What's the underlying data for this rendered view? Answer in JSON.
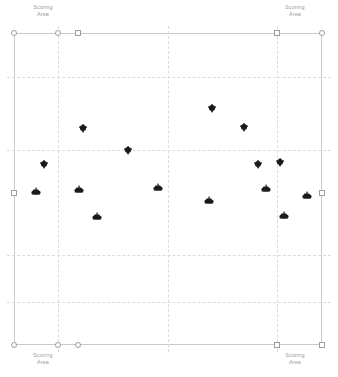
{
  "view": {
    "title": "Competition Field Layout",
    "background_color": "#ffffff",
    "border_color": "#c9c9c9",
    "grid_color": "#dcdcdc",
    "node_color": "#9e9e9e",
    "robot_color": "#1a1a1a",
    "label_color": "#9a9a9a"
  },
  "scoring_labels": [
    {
      "id": "top-left",
      "text": "Scoring\nArea",
      "corner": "tl"
    },
    {
      "id": "top-right",
      "text": "Scoring\nArea",
      "corner": "tr"
    },
    {
      "id": "bottom-left",
      "text": "Scoring\nArea",
      "corner": "bl"
    },
    {
      "id": "bottom-right",
      "text": "Scoring\nArea",
      "corner": "br"
    }
  ],
  "field": {
    "left": 14,
    "top": 33,
    "width": 308,
    "height": 312
  },
  "grid": {
    "vertical_x": [
      58,
      168,
      277
    ],
    "horizontal_y": [
      77,
      150,
      255,
      302
    ]
  },
  "nodes": [
    {
      "id": "n-tl-1",
      "x": 14,
      "y": 33,
      "shape": "circle"
    },
    {
      "id": "n-tl-2",
      "x": 58,
      "y": 33,
      "shape": "circle"
    },
    {
      "id": "n-tl-3",
      "x": 78,
      "y": 33,
      "shape": "square"
    },
    {
      "id": "n-tr-1",
      "x": 277,
      "y": 33,
      "shape": "square"
    },
    {
      "id": "n-tr-2",
      "x": 322,
      "y": 33,
      "shape": "circle"
    },
    {
      "id": "n-ml",
      "x": 14,
      "y": 193,
      "shape": "square"
    },
    {
      "id": "n-mr",
      "x": 322,
      "y": 193,
      "shape": "square"
    },
    {
      "id": "n-bl-1",
      "x": 14,
      "y": 345,
      "shape": "circle"
    },
    {
      "id": "n-bl-2",
      "x": 58,
      "y": 345,
      "shape": "circle"
    },
    {
      "id": "n-bl-3",
      "x": 78,
      "y": 345,
      "shape": "circle"
    },
    {
      "id": "n-br-1",
      "x": 277,
      "y": 345,
      "shape": "square"
    },
    {
      "id": "n-br-2",
      "x": 322,
      "y": 345,
      "shape": "square"
    }
  ],
  "robots": [
    {
      "id": "r01",
      "x": 212,
      "y": 108,
      "heading": "up"
    },
    {
      "id": "r02",
      "x": 83,
      "y": 128,
      "heading": "up"
    },
    {
      "id": "r03",
      "x": 244,
      "y": 127,
      "heading": "up"
    },
    {
      "id": "r04",
      "x": 128,
      "y": 150,
      "heading": "up"
    },
    {
      "id": "r05",
      "x": 44,
      "y": 164,
      "heading": "up"
    },
    {
      "id": "r06",
      "x": 258,
      "y": 164,
      "heading": "up"
    },
    {
      "id": "r07",
      "x": 280,
      "y": 162,
      "heading": "up"
    },
    {
      "id": "r08",
      "x": 36,
      "y": 192,
      "heading": "flat"
    },
    {
      "id": "r09",
      "x": 79,
      "y": 190,
      "heading": "flat"
    },
    {
      "id": "r10",
      "x": 158,
      "y": 188,
      "heading": "flat"
    },
    {
      "id": "r11",
      "x": 266,
      "y": 189,
      "heading": "flat"
    },
    {
      "id": "r12",
      "x": 307,
      "y": 196,
      "heading": "flat"
    },
    {
      "id": "r13",
      "x": 209,
      "y": 201,
      "heading": "flat"
    },
    {
      "id": "r14",
      "x": 97,
      "y": 217,
      "heading": "flat"
    },
    {
      "id": "r15",
      "x": 284,
      "y": 216,
      "heading": "flat"
    }
  ]
}
